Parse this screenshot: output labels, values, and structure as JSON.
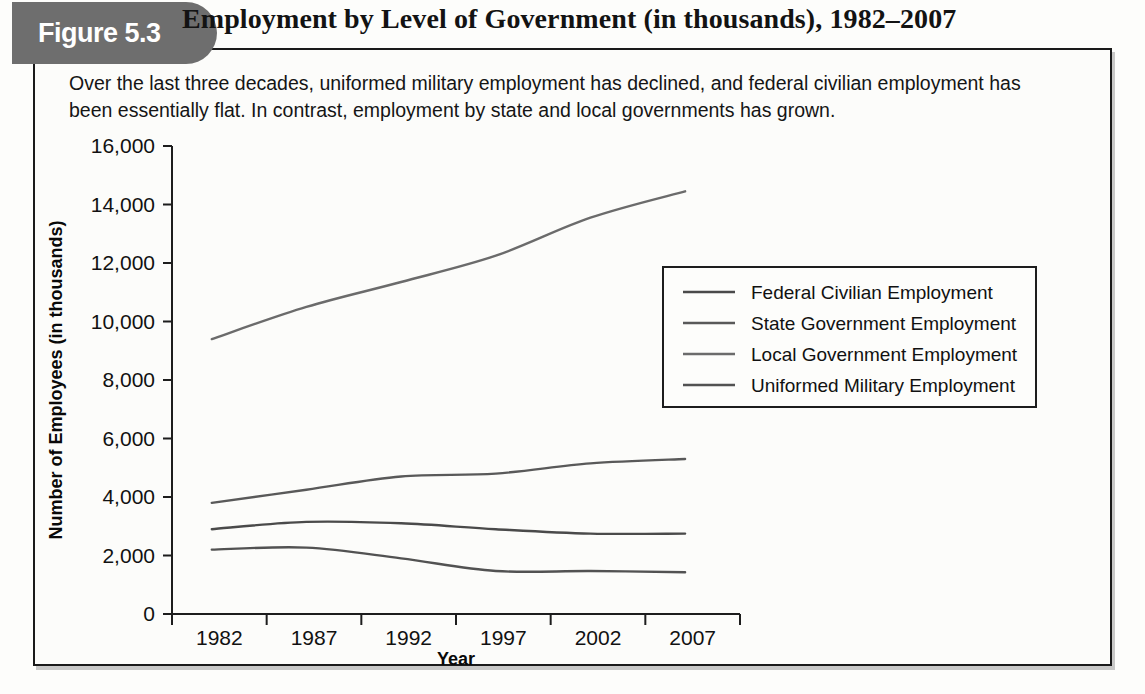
{
  "figure": {
    "badge_label": "Figure 5.3",
    "title": "Employment by Level of Government (in thousands), 1982–2007",
    "caption": "Over the last three decades, uniformed military employment has declined, and federal civilian employment has been essentially flat. In contrast, employment by state and local governments has grown."
  },
  "colors": {
    "badge_bg": "#6e6e6e",
    "border": "#1a1a1a",
    "text": "#111111",
    "series_federal": "#4a4a4a",
    "series_state": "#595959",
    "series_local": "#6b6b6b",
    "series_military": "#525252"
  },
  "chart_data": {
    "type": "line",
    "title": "Employment by Level of Government (in thousands), 1982–2007",
    "xlabel": "Year",
    "ylabel": "Number of Employees (in thousands)",
    "x": [
      1982,
      1987,
      1992,
      1997,
      2002,
      2007
    ],
    "categories": [
      "1982",
      "1987",
      "1992",
      "1997",
      "2002",
      "2007"
    ],
    "xtick_labels": [
      "1982",
      "1987",
      "1992",
      "1997",
      "2002",
      "2007"
    ],
    "ytick_labels": [
      "0",
      "2,000",
      "4,000",
      "6,000",
      "8,000",
      "10,000",
      "12,000",
      "14,000",
      "16,000"
    ],
    "ytick_values": [
      0,
      2000,
      4000,
      6000,
      8000,
      10000,
      12000,
      14000,
      16000
    ],
    "ylim": [
      0,
      16000
    ],
    "grid": false,
    "legend_position": "center-right",
    "series": [
      {
        "name": "Federal Civilian Employment",
        "color": "#4a4a4a",
        "values": [
          2900,
          3150,
          3100,
          2900,
          2750,
          2750
        ]
      },
      {
        "name": "State Government Employment",
        "color": "#595959",
        "values": [
          3800,
          4250,
          4700,
          4800,
          5150,
          5300
        ]
      },
      {
        "name": "Local Government Employment",
        "color": "#6b6b6b",
        "values": [
          9400,
          10500,
          11350,
          12250,
          13550,
          14450
        ]
      },
      {
        "name": "Uniformed Military Employment",
        "color": "#525252",
        "values": [
          2200,
          2270,
          1900,
          1470,
          1470,
          1430
        ]
      }
    ]
  }
}
